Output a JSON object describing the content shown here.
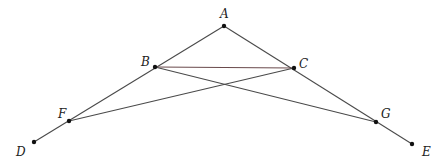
{
  "diagram": {
    "type": "geometry-figure",
    "points": [
      {
        "id": "A",
        "label": "A"
      },
      {
        "id": "B",
        "label": "B"
      },
      {
        "id": "C",
        "label": "C"
      },
      {
        "id": "D",
        "label": "D"
      },
      {
        "id": "E",
        "label": "E"
      },
      {
        "id": "F",
        "label": "F"
      },
      {
        "id": "G",
        "label": "G"
      }
    ],
    "segments": [
      {
        "from": "A",
        "to": "D",
        "passes_through": [
          "B",
          "F"
        ]
      },
      {
        "from": "A",
        "to": "E",
        "passes_through": [
          "C",
          "G"
        ]
      },
      {
        "from": "B",
        "to": "C"
      },
      {
        "from": "B",
        "to": "G"
      },
      {
        "from": "C",
        "to": "F"
      }
    ],
    "colors": {
      "line": "#4a4a4a",
      "bc_line": "#6a4a4c",
      "point": "#111111",
      "label": "#222222"
    }
  }
}
